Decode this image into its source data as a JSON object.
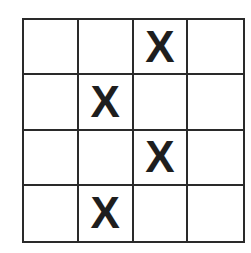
{
  "board": {
    "rows": 4,
    "cols": 4,
    "cells": [
      [
        "",
        "",
        "X",
        ""
      ],
      [
        "",
        "X",
        "",
        ""
      ],
      [
        "",
        "",
        "X",
        ""
      ],
      [
        "",
        "X",
        "",
        ""
      ]
    ]
  }
}
